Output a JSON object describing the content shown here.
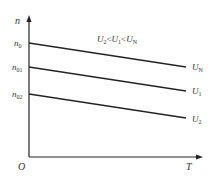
{
  "diagram": {
    "y_axis_label": "n",
    "x_axis_label": "T",
    "origin_label": "O",
    "condition": "U2<U1<UN",
    "y_ticks": [
      {
        "label": "n0",
        "main": "n",
        "sub": "0"
      },
      {
        "label": "n01",
        "main": "n",
        "sub": "01"
      },
      {
        "label": "n02",
        "main": "n",
        "sub": "02"
      }
    ],
    "lines": [
      {
        "label": "UN",
        "main": "U",
        "sub": "N",
        "start": "n0"
      },
      {
        "label": "U1",
        "main": "U",
        "sub": "1",
        "start": "n01"
      },
      {
        "label": "U2",
        "main": "U",
        "sub": "2",
        "start": "n02"
      }
    ]
  }
}
